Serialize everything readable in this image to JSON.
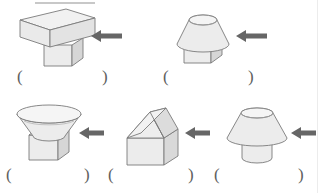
{
  "worksheet": {
    "title": "",
    "background_color": "#ffffff",
    "solid_fill_color": "#e9e9e9",
    "solid_fill_light": "#f2f2f2",
    "solid_fill_dark": "#d8d8d8",
    "outline_color": "#7a7a7a",
    "arrow_color": "#666666",
    "blank_text_color": "#606060",
    "answer_open": "(",
    "answer_close": ")",
    "arrow_direction": "left",
    "arrow_icon_name": "left-arrow-icon"
  },
  "rows": [
    {
      "row_index": 1,
      "items": [
        {
          "index": 1,
          "name": "slab-on-pedestal",
          "description": "flat rectangular cuboid slab resting on a smaller cuboid pedestal",
          "arrow_label": "",
          "answer_open": "(",
          "answer_close": ")",
          "answer_value": ""
        },
        {
          "index": 2,
          "name": "frustum-on-cuboid",
          "description": "truncated cone narrow at top and wide at bottom resting on a cuboid",
          "arrow_label": "",
          "answer_open": "(",
          "answer_close": ")",
          "answer_value": ""
        }
      ]
    },
    {
      "row_index": 2,
      "items": [
        {
          "index": 3,
          "name": "inverted-frustum-on-cube",
          "description": "bowl shaped inverted truncated cone wide at top resting on a cube",
          "arrow_label": "",
          "answer_open": "(",
          "answer_close": ")",
          "answer_value": ""
        },
        {
          "index": 4,
          "name": "house-prism-on-cuboid",
          "description": "hipped pyramid roof on a cuboid forming a house shape",
          "arrow_label": "",
          "answer_open": "(",
          "answer_close": ")",
          "answer_value": ""
        },
        {
          "index": 5,
          "name": "frustum-on-cylinder",
          "description": "truncated cone narrow at top and wide at bottom resting on a cylinder",
          "arrow_label": "",
          "answer_open": "(",
          "answer_close": ")",
          "answer_value": ""
        }
      ]
    }
  ]
}
